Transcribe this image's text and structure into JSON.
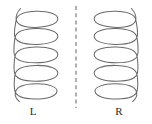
{
  "figure": {
    "background_color": "#ffffff",
    "stroke_color": "#6a6a6a",
    "label_color": "#2b2b2b",
    "mirror": {
      "label": "mirror-plane",
      "orientation": "vertical",
      "x": 76,
      "y_top": 6,
      "y_bottom": 108,
      "dash": "4 3.2",
      "color": "#6a6a6a"
    },
    "objects": [
      {
        "id": "left-helix",
        "label": "L",
        "handedness": "left-handed",
        "turns": 4,
        "label_x": 33,
        "label_y": 115,
        "center_x": 38,
        "loop_rx": 20,
        "loop_ry": 8,
        "loop_spacing": 22,
        "first_loop_cy": 19,
        "strand_side": "left"
      },
      {
        "id": "right-helix",
        "label": "R",
        "handedness": "right-handed",
        "turns": 4,
        "label_x": 119,
        "label_y": 115,
        "center_x": 114,
        "loop_rx": 20,
        "loop_ry": 8,
        "loop_spacing": 22,
        "first_loop_cy": 19,
        "strand_side": "right"
      }
    ]
  }
}
